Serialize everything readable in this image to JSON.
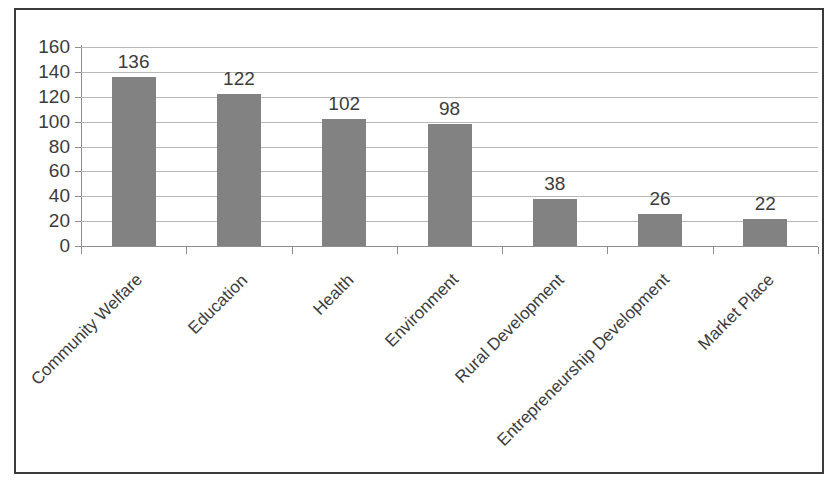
{
  "chart_data": {
    "type": "bar",
    "title": "",
    "subtitle": "",
    "xlabel": "",
    "ylabel": "",
    "categories": [
      "Community Welfare",
      "Education",
      "Health",
      "Environment",
      "Rural Development",
      "Entrepreneurship Development",
      "Market Place"
    ],
    "values": [
      136,
      122,
      102,
      98,
      38,
      26,
      22
    ],
    "data_labels": [
      "136",
      "122",
      "102",
      "98",
      "38",
      "26",
      "22"
    ],
    "ylim": [
      0,
      160
    ],
    "ytick_values": [
      0,
      20,
      40,
      60,
      80,
      100,
      120,
      140,
      160
    ],
    "ytick_labels": [
      "0",
      "20",
      "40",
      "60",
      "80",
      "100",
      "120",
      "140",
      "160"
    ],
    "grid": true,
    "grid_axis": "y",
    "legend": false,
    "legend_position": "none",
    "bar_color": "#828282",
    "grid_color": "#b9b9b9",
    "axis_color": "#8e8e8e",
    "text_color": "#3c3c3c",
    "frame_color": "#3a3a3a",
    "background_color": "#ffffff",
    "category_label_rotation": -45
  }
}
